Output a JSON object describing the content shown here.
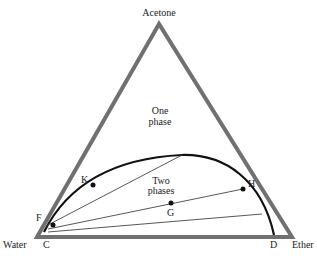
{
  "diagram": {
    "type": "ternary-phase-diagram",
    "vertices": {
      "top": {
        "label": "Acetone",
        "x": 159,
        "y": 24
      },
      "left": {
        "label": "Water",
        "x": 37,
        "y": 237
      },
      "right": {
        "label": "Ether",
        "x": 292,
        "y": 237
      }
    },
    "regions": {
      "one_phase": {
        "line1": "One",
        "line2": "phase"
      },
      "two_phases": {
        "line1": "Two",
        "line2": "phases"
      }
    },
    "points": {
      "C": {
        "label": "C"
      },
      "D": {
        "label": "D"
      },
      "F": {
        "label": "F"
      },
      "K": {
        "label": "K"
      },
      "H": {
        "label": "H"
      },
      "G": {
        "label": "G"
      }
    },
    "colors": {
      "triangle": "#6e6e6e",
      "curve": "#111111",
      "tielines": "#444444",
      "text": "#222222"
    }
  }
}
